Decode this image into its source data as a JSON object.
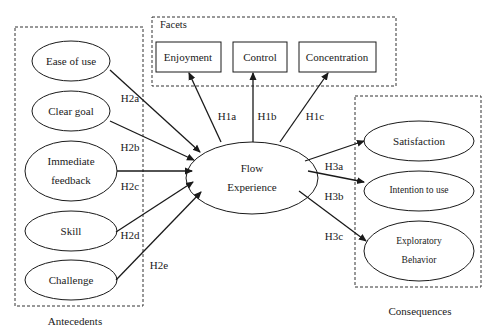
{
  "groups": {
    "antecedents": "Antecedents",
    "facets": "Facets",
    "consequences": "Consequences"
  },
  "center": {
    "line1": "Flow",
    "line2": "Experience"
  },
  "antecedents": [
    {
      "label": "Ease of use"
    },
    {
      "label": "Clear goal"
    },
    {
      "line1": "Immediate",
      "line2": "feedback"
    },
    {
      "label": "Skill"
    },
    {
      "label": "Challenge"
    }
  ],
  "facets": [
    {
      "label": "Enjoyment"
    },
    {
      "label": "Control"
    },
    {
      "label": "Concentration"
    }
  ],
  "consequences": [
    {
      "label": "Satisfaction"
    },
    {
      "label": "Intention to use"
    },
    {
      "line1": "Exploratory",
      "line2": "Behavior"
    }
  ],
  "hypotheses": {
    "h1a": "H1a",
    "h1b": "H1b",
    "h1c": "H1c",
    "h2a": "H2a",
    "h2b": "H2b",
    "h2c": "H2c",
    "h2d": "H2d",
    "h2e": "H2e",
    "h3a": "H3a",
    "h3b": "H3b",
    "h3c": "H3c"
  }
}
